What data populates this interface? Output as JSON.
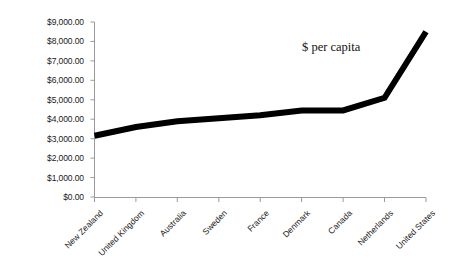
{
  "chart_data": {
    "type": "line",
    "title": "",
    "subtitle": "",
    "xlabel": "",
    "ylabel": "",
    "annotation": "$ per capita",
    "grid": false,
    "legend": "none",
    "ylim": [
      0,
      9000
    ],
    "ytick_labels": [
      "$9,000.00",
      "$8,000.00",
      "$7,000.00",
      "$6,000.00",
      "$5,000.00",
      "$4,000.00",
      "$3,000.00",
      "$2,000.00",
      "$1,000.00",
      "$0.00"
    ],
    "ytick_values": [
      9000,
      8000,
      7000,
      6000,
      5000,
      4000,
      3000,
      2000,
      1000,
      0
    ],
    "categories": [
      "New Zealand",
      "United Kingdom",
      "Australia",
      "Sweden",
      "France",
      "Denmark",
      "Canada",
      "Netherlands",
      "United States"
    ],
    "values": [
      3150,
      3600,
      3900,
      4050,
      4200,
      4450,
      4450,
      5100,
      8500
    ],
    "series": [
      {
        "name": "$ per capita",
        "color": "#000000",
        "values": [
          3150,
          3600,
          3900,
          4050,
          4200,
          4450,
          4450,
          5100,
          8500
        ]
      }
    ],
    "line_color": "#000000",
    "line_width": 6,
    "markers": false,
    "axis_color": "#9a9a9a"
  }
}
